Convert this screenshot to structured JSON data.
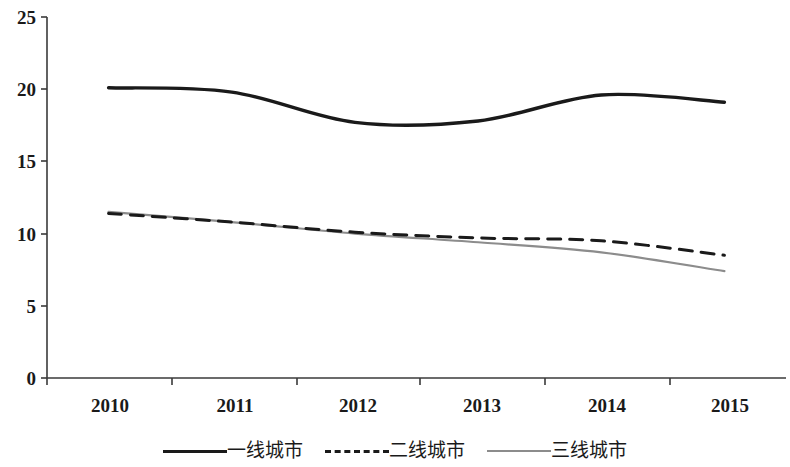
{
  "chart_data": {
    "type": "line",
    "title": "",
    "subtitle": "",
    "xlabel": "",
    "ylabel": "",
    "categories": [
      "2010",
      "2011",
      "2012",
      "2013",
      "2014",
      "2015"
    ],
    "ylim": [
      0,
      25
    ],
    "yticks": [
      0,
      5,
      10,
      15,
      20,
      25
    ],
    "ytick_labels": [
      "0",
      "5",
      "10",
      "15",
      "20",
      "25"
    ],
    "grid": false,
    "legend_position": "bottom-center",
    "series": [
      {
        "name": "一线城市",
        "style": "solid",
        "color": "#1a1a1a",
        "width": 3.4,
        "values": [
          20.1,
          19.8,
          17.7,
          17.8,
          19.6,
          19.1
        ]
      },
      {
        "name": "二线城市",
        "style": "dashed",
        "color": "#1a1a1a",
        "width": 3.0,
        "values": [
          11.4,
          10.8,
          10.1,
          9.7,
          9.5,
          8.5
        ]
      },
      {
        "name": "三线城市",
        "style": "solid",
        "color": "#8c8c8c",
        "width": 2.2,
        "values": [
          11.5,
          10.8,
          10.0,
          9.4,
          8.7,
          7.4
        ]
      }
    ]
  },
  "axes": {
    "axis_color": "#3a3a3a",
    "y_labels": [
      "25",
      "20",
      "15",
      "10",
      "5",
      "0"
    ],
    "x_labels": [
      "2010",
      "2011",
      "2012",
      "2013",
      "2014",
      "2015"
    ]
  },
  "legend": {
    "items": [
      {
        "label": "一线城市",
        "swatch": "solid-black-line-icon"
      },
      {
        "label": "二线城市",
        "swatch": "dashed-black-line-icon"
      },
      {
        "label": "三线城市",
        "swatch": "solid-gray-line-icon"
      }
    ]
  }
}
